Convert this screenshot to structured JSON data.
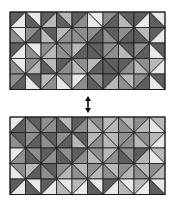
{
  "figure": {
    "palette": [
      "#e8e8e8",
      "#b8b8b8",
      "#8e8e8e",
      "#5e5e5e"
    ],
    "grid_line_color": "#1a1a1a",
    "arrow_color": "#111111",
    "top_grid": {
      "x": 10,
      "y": 12,
      "cols": 10,
      "rows": 5,
      "cell": 15.5,
      "shades": [
        [
          [
            3,
            0
          ],
          [
            0,
            3
          ],
          [
            3,
            1
          ],
          [
            1,
            3
          ],
          [
            3,
            2
          ],
          [
            0,
            0
          ],
          [
            2,
            3
          ],
          [
            3,
            1
          ],
          [
            3,
            0
          ],
          [
            0,
            3
          ]
        ],
        [
          [
            0,
            2
          ],
          [
            2,
            3
          ],
          [
            3,
            1
          ],
          [
            1,
            2
          ],
          [
            2,
            2
          ],
          [
            2,
            3
          ],
          [
            3,
            2
          ],
          [
            2,
            3
          ],
          [
            1,
            3
          ],
          [
            3,
            0
          ]
        ],
        [
          [
            3,
            0
          ],
          [
            0,
            2
          ],
          [
            2,
            1
          ],
          [
            2,
            2
          ],
          [
            1,
            3
          ],
          [
            3,
            3
          ],
          [
            2,
            2
          ],
          [
            3,
            1
          ],
          [
            2,
            3
          ],
          [
            3,
            0
          ]
        ],
        [
          [
            0,
            2
          ],
          [
            2,
            1
          ],
          [
            1,
            3
          ],
          [
            3,
            2
          ],
          [
            2,
            1
          ],
          [
            1,
            3
          ],
          [
            3,
            3
          ],
          [
            3,
            2
          ],
          [
            2,
            1
          ],
          [
            1,
            0
          ]
        ],
        [
          [
            2,
            3
          ],
          [
            3,
            0
          ],
          [
            1,
            2
          ],
          [
            2,
            0
          ],
          [
            0,
            2
          ],
          [
            2,
            3
          ],
          [
            3,
            1
          ],
          [
            1,
            2
          ],
          [
            2,
            3
          ],
          [
            3,
            0
          ]
        ]
      ]
    },
    "bottom_grid": {
      "x": 10,
      "y": 117,
      "cols": 10,
      "rows": 5,
      "cell": 15.5,
      "shades": [
        [
          [
            0,
            3
          ],
          [
            3,
            2
          ],
          [
            2,
            2
          ],
          [
            1,
            3
          ],
          [
            3,
            2
          ],
          [
            2,
            1
          ],
          [
            1,
            1
          ],
          [
            1,
            2
          ],
          [
            2,
            1
          ],
          [
            1,
            0
          ]
        ],
        [
          [
            3,
            2
          ],
          [
            2,
            3
          ],
          [
            3,
            2
          ],
          [
            2,
            3
          ],
          [
            3,
            1
          ],
          [
            1,
            2
          ],
          [
            1,
            1
          ],
          [
            2,
            2
          ],
          [
            2,
            1
          ],
          [
            1,
            0
          ]
        ],
        [
          [
            0,
            2
          ],
          [
            2,
            3
          ],
          [
            3,
            2
          ],
          [
            2,
            3
          ],
          [
            3,
            2
          ],
          [
            2,
            1
          ],
          [
            1,
            2
          ],
          [
            2,
            3
          ],
          [
            3,
            1
          ],
          [
            1,
            0
          ]
        ],
        [
          [
            2,
            0
          ],
          [
            1,
            3
          ],
          [
            3,
            2
          ],
          [
            2,
            1
          ],
          [
            1,
            2
          ],
          [
            2,
            1
          ],
          [
            1,
            2
          ],
          [
            2,
            1
          ],
          [
            1,
            2
          ],
          [
            2,
            1
          ]
        ],
        [
          [
            3,
            0
          ],
          [
            0,
            3
          ],
          [
            3,
            0
          ],
          [
            0,
            1
          ],
          [
            1,
            0
          ],
          [
            0,
            3
          ],
          [
            3,
            0
          ],
          [
            0,
            1
          ],
          [
            1,
            0
          ],
          [
            0,
            3
          ]
        ]
      ]
    },
    "arrow": {
      "x": 88,
      "y1": 96,
      "y2": 113
    }
  }
}
